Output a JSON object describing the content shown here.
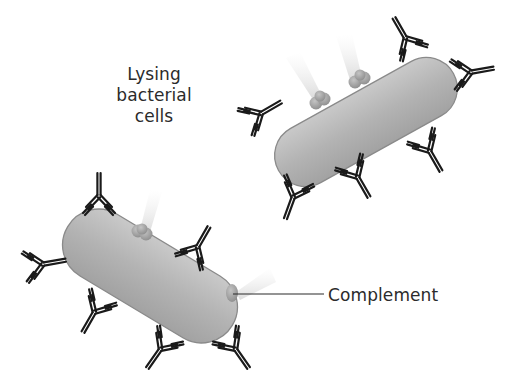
{
  "diagram": {
    "title_label": {
      "lines": [
        "Lysing",
        "bacterial",
        "cells"
      ]
    },
    "callout_label": "Complement",
    "elements": {
      "bacteria": [
        {
          "name": "bacterium-upper-right",
          "shape": "rod",
          "color": "#b9b9b9",
          "outline": "#8a8a8a"
        },
        {
          "name": "bacterium-lower-left",
          "shape": "rod",
          "color": "#b9b9b9",
          "outline": "#8a8a8a"
        }
      ],
      "antibody_count_upper": 8,
      "antibody_count_lower": 8,
      "complement_clusters": 4
    },
    "colors": {
      "background": "#ffffff",
      "antibody": "#1a1a1a",
      "bacterium_fill": "#b5b5b5",
      "complement": "#a8a8a8",
      "text": "#2b2b2b"
    }
  }
}
